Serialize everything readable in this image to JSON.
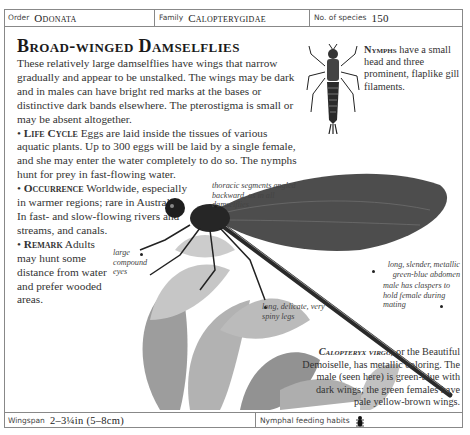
{
  "header": {
    "order_label": "Order",
    "order_value": "Odonata",
    "family_label": "Family",
    "family_value": "Calopterygidae",
    "species_label": "No. of species",
    "species_value": "150"
  },
  "title": "Broad-winged Damselflies",
  "intro": "These relatively large damselflies have wings that narrow gradually and appear to be unstalked. The wings may be dark and in males can have bright red marks at the bases or distinctive dark bands elsewhere. The pterostigma is small or may be absent altogether.",
  "sections": [
    {
      "heading": "Life Cycle",
      "text": "Eggs are laid inside the tissues of various aquatic plants. Up to 300 eggs will be laid by a single female, and she may enter the water completely to do so. The nymphs hunt for prey in fast-flowing water."
    },
    {
      "heading": "Occurrence",
      "text": "Worldwide, especially in warmer regions; rare in Australia. In fast- and slow-flowing rivers and streams, and canals."
    },
    {
      "heading": "Remark",
      "text": "Adults may hunt some distance from water and prefer wooded areas."
    }
  ],
  "nymph": {
    "heading": "Nymphs",
    "text": "have a small head and three prominent, flaplike gill filaments."
  },
  "captions": {
    "thoracic": "thoracic segments angled backward, as in all damselflies",
    "eyes": "large compound eyes",
    "abdomen": "long, slender, metallic green-blue abdomen",
    "claspers": "male has claspers to hold female during mating",
    "legs": "long, delicate, very spiny legs"
  },
  "species_note": {
    "name": "Calopteryx virgo,",
    "text": "or the Beautiful Demoiselle, has metallic coloring. The male (seen here) is green-blue with dark wings; the green females have pale yellow-brown wings."
  },
  "footer": {
    "wingspan_label": "Wingspan",
    "wingspan_value": "2–3¼in (5–8cm)",
    "feeding_label": "Nymphal feeding habits",
    "feeding_icon": "predator-beetle-icon"
  }
}
